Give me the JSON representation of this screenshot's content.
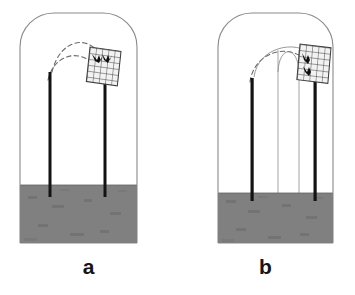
{
  "figure": {
    "background_color": "#ffffff",
    "panels": [
      {
        "id": "a",
        "label": "a",
        "enclosure": {
          "name": "flight-cage-outline",
          "shape": "rounded-top rectangle",
          "stroke_color": "#8a8a8a",
          "fill_color": "#ffffff",
          "x": 20,
          "y": 13,
          "width": 117,
          "height": 230,
          "corner_radius": 34
        },
        "substrate": {
          "name": "ground-block",
          "fill_color": "#808080",
          "stroke_color": "#5d5d5d",
          "x": 20,
          "y": 185,
          "width": 117,
          "height": 58
        },
        "perches": [
          {
            "name": "launch-perch",
            "x": 50,
            "top_y": 72,
            "bottom_y": 197,
            "color": "#1a1a1a",
            "width": 3
          },
          {
            "name": "net-perch",
            "x": 105,
            "top_y": 75,
            "bottom_y": 197,
            "color": "#1a1a1a",
            "width": 3
          }
        ],
        "net": {
          "name": "mist-net-grid",
          "x": 90,
          "y": 47,
          "width": 31,
          "height": 35,
          "columns": 5,
          "rows": 6,
          "stroke_color": "#3c3c3c",
          "fill_color": "#f2f2f2",
          "skew_deg": -12
        },
        "birds": [
          {
            "name": "bird-marker-1",
            "x": 95,
            "y": 58
          },
          {
            "name": "bird-marker-2",
            "x": 105,
            "y": 58
          }
        ],
        "trajectories": [
          {
            "name": "flight-path-upper",
            "style": "dashed",
            "stroke_color": "#6b6b6b",
            "path": "M 52 72 C 60 38 90 35 100 58"
          },
          {
            "name": "flight-path-lower",
            "style": "dashed",
            "stroke_color": "#6b6b6b",
            "path": "M 48 79 C 56 52 82 49 95 66"
          }
        ],
        "trajectory_count": 2,
        "vertical_guides": []
      },
      {
        "id": "b",
        "label": "b",
        "enclosure": {
          "name": "flight-cage-outline",
          "shape": "rounded-top rectangle",
          "stroke_color": "#8a8a8a",
          "fill_color": "#ffffff",
          "x": 218,
          "y": 13,
          "width": 115,
          "height": 230,
          "corner_radius": 34
        },
        "substrate": {
          "name": "ground-block",
          "fill_color": "#808080",
          "stroke_color": "#5d5d5d",
          "x": 218,
          "y": 193,
          "width": 115,
          "height": 50
        },
        "perches": [
          {
            "name": "launch-perch",
            "x": 252,
            "top_y": 78,
            "bottom_y": 201,
            "color": "#1a1a1a",
            "width": 3
          },
          {
            "name": "net-perch",
            "x": 315,
            "top_y": 72,
            "bottom_y": 201,
            "color": "#1a1a1a",
            "width": 3
          }
        ],
        "net": {
          "name": "mist-net-grid",
          "x": 300,
          "y": 44,
          "width": 31,
          "height": 36,
          "columns": 5,
          "rows": 6,
          "stroke_color": "#3c3c3c",
          "fill_color": "#f2f2f2",
          "skew_deg": -10
        },
        "birds": [
          {
            "name": "bird-marker-1",
            "x": 308,
            "y": 57
          },
          {
            "name": "bird-marker-2",
            "x": 308,
            "y": 69
          }
        ],
        "trajectories": [
          {
            "name": "flight-path-dashed-low",
            "style": "dashed",
            "stroke_color": "#6b6b6b",
            "path": "M 250 81 C 256 52 288 43 306 62"
          },
          {
            "name": "flight-path-arc-mid",
            "style": "solid",
            "stroke_color": "#8a8a8a",
            "path": "M 253 76 C 258 46 296 40 310 56"
          },
          {
            "name": "flight-path-dome",
            "style": "solid",
            "stroke_color": "#8a8a8a",
            "path": "M 278 72 C 280 44 297 44 299 72"
          }
        ],
        "trajectory_count": 3,
        "vertical_guides": [
          {
            "name": "guide-line-left",
            "x": 278,
            "top_y": 50,
            "bottom_y": 200,
            "stroke_color": "#9a9a9a"
          },
          {
            "name": "guide-line-right",
            "x": 299,
            "top_y": 50,
            "bottom_y": 200,
            "stroke_color": "#9a9a9a"
          }
        ]
      }
    ]
  }
}
